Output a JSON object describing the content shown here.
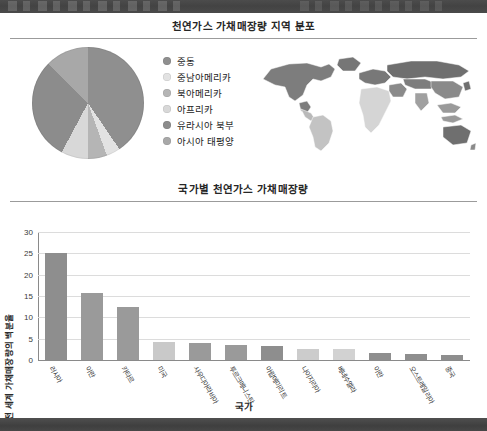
{
  "page": {
    "background": "#ffffff",
    "header_band_color": "#474747",
    "footer_band_color": "#474747"
  },
  "figure_pie": {
    "title": "천연가스 가채매장량 지역 분포",
    "map_name": "world-map-grayscale"
  },
  "figure_bar": {
    "title": "국가별 천연가스 가채매장량"
  },
  "chart_data": [
    {
      "type": "pie",
      "title": "천연가스 가채매장량 지역 분포",
      "legend_position": "right",
      "categories": [
        "중동",
        "중남아메리카",
        "북아메리카",
        "아프리카",
        "유라시아 북부",
        "아시아 태평양"
      ],
      "values": [
        40.5,
        4.0,
        5.5,
        7.8,
        29.5,
        12.7
      ],
      "colors": [
        "#8f8f8f",
        "#e2e2e2",
        "#b5b5b5",
        "#d8d8d8",
        "#8c8c8c",
        "#a8a8a8"
      ]
    },
    {
      "type": "bar",
      "title": "국가별 천연가스 가채매장량",
      "xlabel": "국가",
      "ylabel": "전 세계 가채매장량의 백분율",
      "ylim": [
        0,
        30
      ],
      "yticks": [
        0,
        5,
        10,
        15,
        20,
        25,
        30
      ],
      "grid": true,
      "categories": [
        "러시아",
        "이란",
        "카타르",
        "미국",
        "사우디아라비아",
        "투르크메니스탄",
        "아랍에미리트",
        "나이지리아",
        "베네수엘라",
        "이란",
        "오스트레일리아",
        "중국"
      ],
      "values": [
        25.0,
        15.7,
        12.4,
        4.2,
        3.9,
        3.6,
        3.4,
        2.6,
        2.5,
        1.6,
        1.4,
        1.2
      ],
      "bar_colors": [
        "#8e8e8e",
        "#9a9a9a",
        "#9a9a9a",
        "#c9c9c9",
        "#9a9a9a",
        "#9a9a9a",
        "#8e8e8e",
        "#cccccc",
        "#d2d2d2",
        "#8e8e8e",
        "#8e8e8e",
        "#8e8e8e"
      ]
    }
  ]
}
